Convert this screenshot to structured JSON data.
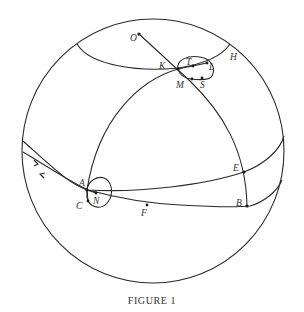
{
  "figure": {
    "caption": "FIGURE 1",
    "type": "celestial sphere diagram",
    "colors": {
      "stroke": "#2a2a2a",
      "text": "#333333",
      "background": "#ffffff"
    },
    "points": {
      "O": "O",
      "K": "K",
      "T": "T",
      "L": "L",
      "H": "H",
      "M": "M",
      "S": "S",
      "A": "A",
      "N": "N",
      "C": "C",
      "F": "F",
      "E": "E",
      "B": "B"
    },
    "arrows": [
      "arrow-right",
      "arrow-left"
    ]
  }
}
